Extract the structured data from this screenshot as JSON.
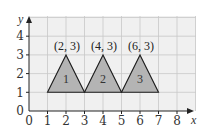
{
  "diagram": {
    "type": "coordinate-grid-with-triangles",
    "axes": {
      "x_label": "x",
      "y_label": "y",
      "x_ticks": [
        "0",
        "1",
        "2",
        "3",
        "4",
        "5",
        "6",
        "7",
        "8"
      ],
      "y_ticks": [
        "0",
        "1",
        "2",
        "3",
        "4"
      ]
    },
    "triangles": [
      {
        "label": "1",
        "apex_label": "(2, 3)",
        "vertices": [
          [
            1,
            1
          ],
          [
            2,
            3
          ],
          [
            3,
            1
          ]
        ]
      },
      {
        "label": "2",
        "apex_label": "(4, 3)",
        "vertices": [
          [
            3,
            1
          ],
          [
            4,
            3
          ],
          [
            5,
            1
          ]
        ]
      },
      {
        "label": "3",
        "apex_label": "(6, 3)",
        "vertices": [
          [
            5,
            1
          ],
          [
            6,
            3
          ],
          [
            7,
            1
          ]
        ]
      }
    ],
    "colors": {
      "grid_background": "#f0f0f0",
      "grid_line": "#c8c8c8",
      "triangle_fill": "#b4b4b4",
      "triangle_stroke": "#1a1a1a",
      "axis": "#222222"
    }
  }
}
